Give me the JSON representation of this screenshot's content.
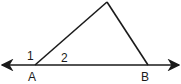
{
  "diagram": {
    "type": "geometry-triangle-exterior-angle",
    "colors": {
      "stroke": "#1a1a1a",
      "background": "#ffffff"
    },
    "line": {
      "x1": 2,
      "y1": 65,
      "x2": 179,
      "y2": 65,
      "arrows": "both"
    },
    "points": {
      "A": {
        "x": 35,
        "y": 65,
        "label": "A",
        "label_x": 28,
        "label_y": 81
      },
      "B": {
        "x": 148,
        "y": 65,
        "label": "B",
        "label_x": 141,
        "label_y": 81
      },
      "apex": {
        "x": 107,
        "y": 2
      }
    },
    "angles": [
      {
        "label": "1",
        "x": 27,
        "y": 60
      },
      {
        "label": "2",
        "x": 61,
        "y": 62
      }
    ]
  }
}
